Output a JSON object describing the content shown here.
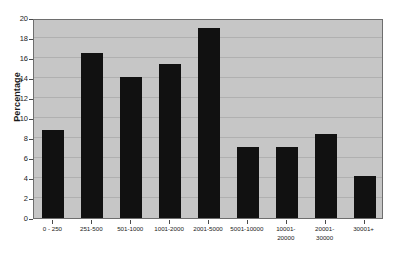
{
  "chart_data": {
    "type": "bar",
    "title": "",
    "xlabel": "",
    "ylabel": "Percentage",
    "categories": [
      "0 - 250",
      "251-500",
      "501-1000",
      "1001-2000",
      "2001-5000",
      "5001-10000",
      "10001-\n20000",
      "20001-\n30000",
      "30001+"
    ],
    "values": [
      8.8,
      16.5,
      14.1,
      15.4,
      19.0,
      7.1,
      7.1,
      8.4,
      4.2
    ],
    "ylim": [
      0,
      20
    ],
    "ytick_labels": [
      "0",
      "2",
      "4",
      "6",
      "8",
      "10",
      "12",
      "14",
      "16",
      "18",
      "20"
    ],
    "ytick_values": [
      0,
      2,
      4,
      6,
      8,
      10,
      12,
      14,
      16,
      18,
      20
    ],
    "grid": true,
    "legend": "none",
    "colors": {
      "bar": "#111111",
      "plot_background": "#c6c6c6",
      "page_background": "#ffffff",
      "gridline": "#b0b0b0",
      "axis": "#6e6e6e",
      "text": "#1a1a1a"
    }
  }
}
